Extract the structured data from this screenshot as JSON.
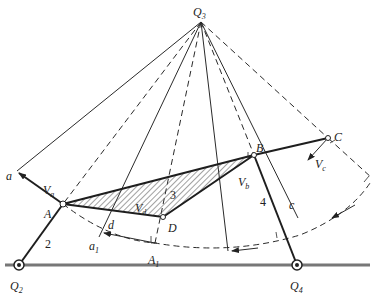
{
  "figure": {
    "type": "four-bar linkage instant-center velocity diagram",
    "colors": {
      "line": "#2a2a2a",
      "ground": "#777777",
      "hatch": "#444444",
      "background": "#ffffff"
    }
  },
  "labels": {
    "Q3": "Q",
    "Q3_sub": "3",
    "Q2": "Q",
    "Q2_sub": "2",
    "Q4": "Q",
    "Q4_sub": "4",
    "A": "A",
    "B": "B",
    "C": "C",
    "D": "D",
    "a": "a",
    "a1": "a",
    "a1_sub": "1",
    "A1": "A",
    "A1_sub": "1",
    "c": "c",
    "d": "d",
    "Va": "V",
    "Va_sub": "a",
    "Vb": "V",
    "Vb_sub": "b",
    "Vc": "V",
    "Vc_sub": "c",
    "Vd": "V",
    "Vd_sub": "d",
    "link2": "2",
    "link3": "3",
    "link4": "4"
  },
  "points": {
    "Q3": [
      201,
      22
    ],
    "Q2": [
      19,
      265
    ],
    "Q4": [
      297,
      265
    ],
    "A": [
      63,
      204
    ],
    "B": [
      254,
      155
    ],
    "C": [
      328,
      138
    ],
    "D": [
      163,
      217
    ]
  }
}
